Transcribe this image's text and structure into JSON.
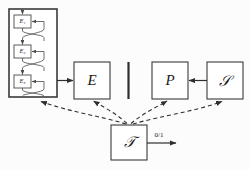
{
  "diagram": {
    "background_color": "#fcfcfc",
    "line_color": "#2e2e2e",
    "box_fill_color": "#ffffff",
    "encoder_stack": {
      "name": "encoder-stack",
      "units": [
        {
          "label": "E₁",
          "sub": "1"
        },
        {
          "label": "E₂",
          "sub": "2"
        },
        {
          "label": "E₃",
          "sub": "3"
        }
      ]
    },
    "blocks": [
      {
        "id": "E",
        "label": "E",
        "style": "italic"
      },
      {
        "id": "P",
        "label": "P",
        "style": "italic"
      },
      {
        "id": "S",
        "label": "𝒮",
        "style": "script"
      },
      {
        "id": "D",
        "label": "𝒯",
        "style": "script"
      }
    ],
    "edge_labels": {
      "discriminator_output": "0/1"
    },
    "divider": {
      "name": "vertical-divider",
      "present": true
    }
  }
}
